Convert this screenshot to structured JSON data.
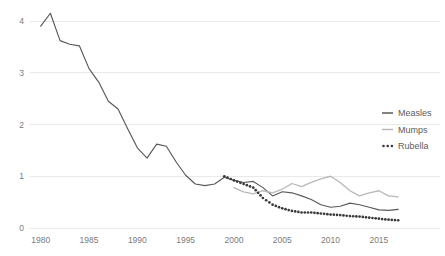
{
  "chart_data": {
    "type": "line",
    "title": "",
    "subtitle": "",
    "xlabel": "",
    "ylabel": "",
    "xlim": [
      1979.2,
      2017.6
    ],
    "ylim": [
      0,
      4.35
    ],
    "xticks": [
      "1980",
      "1985",
      "1990",
      "1995",
      "2000",
      "2005",
      "2010",
      "2015"
    ],
    "xtick_values": [
      1980,
      1985,
      1990,
      1995,
      2000,
      2005,
      2010,
      2015
    ],
    "yticks": [
      "0",
      "1",
      "2",
      "3",
      "4"
    ],
    "ytick_values": [
      0,
      1,
      2,
      3,
      4
    ],
    "grid": "horizontal",
    "legend_position": "right-middle",
    "series": [
      {
        "name": "Measles",
        "style": "solid",
        "color": "#595959",
        "x": [
          1980,
          1981,
          1982,
          1983,
          1984,
          1985,
          1986,
          1987,
          1988,
          1989,
          1990,
          1991,
          1992,
          1993,
          1994,
          1995,
          1996,
          1997,
          1998,
          1999,
          2000,
          2001,
          2002,
          2003,
          2004,
          2005,
          2006,
          2007,
          2008,
          2009,
          2010,
          2011,
          2012,
          2013,
          2014,
          2015,
          2016,
          2017
        ],
        "values": [
          3.9,
          4.15,
          3.62,
          3.55,
          3.52,
          3.08,
          2.82,
          2.45,
          2.3,
          1.92,
          1.55,
          1.35,
          1.62,
          1.58,
          1.28,
          1.02,
          0.85,
          0.82,
          0.85,
          0.98,
          0.92,
          0.88,
          0.9,
          0.78,
          0.62,
          0.7,
          0.68,
          0.62,
          0.55,
          0.45,
          0.4,
          0.42,
          0.48,
          0.45,
          0.4,
          0.35,
          0.34,
          0.36
        ]
      },
      {
        "name": "Mumps",
        "style": "solid-light",
        "color": "#b8b8b8",
        "x": [
          2000,
          2001,
          2002,
          2003,
          2004,
          2005,
          2006,
          2007,
          2008,
          2009,
          2010,
          2011,
          2012,
          2013,
          2014,
          2015,
          2016,
          2017
        ],
        "values": [
          0.78,
          0.7,
          0.66,
          0.72,
          0.68,
          0.75,
          0.86,
          0.8,
          0.88,
          0.95,
          1.0,
          0.88,
          0.72,
          0.62,
          0.68,
          0.72,
          0.62,
          0.6
        ]
      },
      {
        "name": "Rubella",
        "style": "dotted",
        "color": "#3a3a3a",
        "x": [
          1999,
          2000,
          2001,
          2002,
          2003,
          2004,
          2005,
          2006,
          2007,
          2008,
          2009,
          2010,
          2011,
          2012,
          2013,
          2014,
          2015,
          2016,
          2017
        ],
        "values": [
          1.0,
          0.92,
          0.85,
          0.78,
          0.58,
          0.45,
          0.38,
          0.33,
          0.3,
          0.3,
          0.28,
          0.26,
          0.25,
          0.23,
          0.22,
          0.2,
          0.18,
          0.16,
          0.15
        ]
      }
    ],
    "legend": [
      {
        "label": "Measles",
        "marker": "line",
        "color": "#595959"
      },
      {
        "label": "Mumps",
        "marker": "line",
        "color": "#b8b8b8"
      },
      {
        "label": "Rubella",
        "marker": "dots",
        "color": "#3a3a3a"
      }
    ]
  }
}
